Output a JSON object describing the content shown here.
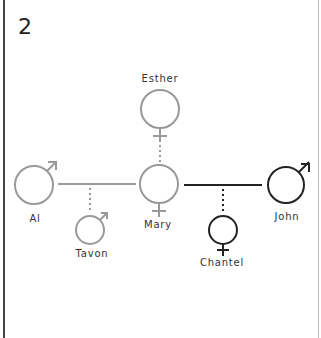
{
  "panel": {
    "number": "2"
  },
  "colors": {
    "faded": "#999999",
    "dark": "#222222"
  },
  "people": {
    "esther": {
      "name": "Esther",
      "sex": "female",
      "tone": "faded"
    },
    "al": {
      "name": "Al",
      "sex": "male",
      "tone": "faded"
    },
    "mary": {
      "name": "Mary",
      "sex": "female",
      "tone": "faded"
    },
    "tavon": {
      "name": "Tavon",
      "sex": "male",
      "tone": "faded"
    },
    "john": {
      "name": "John",
      "sex": "male",
      "tone": "dark"
    },
    "chantel": {
      "name": "Chantel",
      "sex": "female",
      "tone": "dark"
    }
  },
  "relations": [
    {
      "type": "parent-child",
      "from": "esther",
      "to": "mary",
      "tone": "faded"
    },
    {
      "type": "partnership",
      "a": "al",
      "b": "mary",
      "tone": "faded"
    },
    {
      "type": "parent-child",
      "from": "al-mary",
      "to": "tavon",
      "tone": "faded"
    },
    {
      "type": "partnership",
      "a": "mary",
      "b": "john",
      "tone": "dark"
    },
    {
      "type": "parent-child",
      "from": "mary-john",
      "to": "chantel",
      "tone": "dark"
    }
  ]
}
